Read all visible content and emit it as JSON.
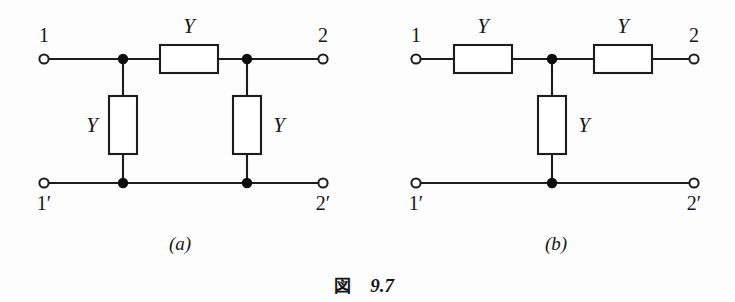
{
  "figure": {
    "caption_kanji": "図",
    "caption_number": "9.7",
    "subcaption_a": "(a)",
    "subcaption_b": "(b)"
  },
  "circuit_a": {
    "name": "pi-network",
    "terminals": {
      "top_left": "1",
      "top_right": "2",
      "bottom_left": "1′",
      "bottom_right": "2′"
    },
    "components": [
      {
        "id": "a-series-y",
        "label": "Y",
        "orientation": "horizontal",
        "label_position": "above"
      },
      {
        "id": "a-shunt-left-y",
        "label": "Y",
        "orientation": "vertical",
        "label_position": "left"
      },
      {
        "id": "a-shunt-right-y",
        "label": "Y",
        "orientation": "vertical",
        "label_position": "right"
      }
    ]
  },
  "circuit_b": {
    "name": "tee-network",
    "terminals": {
      "top_left": "1",
      "top_right": "2",
      "bottom_left": "1′",
      "bottom_right": "2′"
    },
    "components": [
      {
        "id": "b-series-left-y",
        "label": "Y",
        "orientation": "horizontal",
        "label_position": "above"
      },
      {
        "id": "b-series-right-y",
        "label": "Y",
        "orientation": "horizontal",
        "label_position": "above"
      },
      {
        "id": "b-shunt-y",
        "label": "Y",
        "orientation": "vertical",
        "label_position": "right"
      }
    ]
  },
  "colors": {
    "line": "#1c1c1c",
    "node": "#0d0d0d",
    "background": "#fdfdfd",
    "box_fill": "#ffffff"
  }
}
